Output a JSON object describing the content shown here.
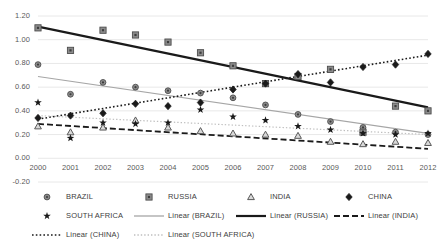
{
  "chart_data": {
    "type": "scatter",
    "title": "",
    "xlabel": "",
    "ylabel": "",
    "x": [
      2000,
      2001,
      2002,
      2003,
      2004,
      2005,
      2006,
      2007,
      2008,
      2009,
      2010,
      2011,
      2012
    ],
    "xlim": [
      1999.5,
      2012.5
    ],
    "ylim": [
      -0.2,
      1.2
    ],
    "yticks": [
      "-0.20",
      "0.00",
      "0.20",
      "0.40",
      "0.60",
      "0.80",
      "1.00",
      "1.20"
    ],
    "xticks": [
      "2000",
      "2001",
      "2002",
      "2003",
      "2004",
      "2005",
      "2006",
      "2007",
      "2008",
      "2009",
      "2010",
      "2011",
      "2012"
    ],
    "grid": "horizontal",
    "legend_position": "bottom",
    "series": [
      {
        "name": "BRAZIL",
        "marker": "circle",
        "color": "#808080",
        "values": [
          0.79,
          0.54,
          0.64,
          0.6,
          0.57,
          0.55,
          0.51,
          0.45,
          0.37,
          0.31,
          0.26,
          0.22,
          0.2
        ]
      },
      {
        "name": "RUSSIA",
        "marker": "square",
        "color": "#808080",
        "values": [
          1.1,
          0.91,
          1.08,
          1.04,
          0.98,
          0.89,
          0.78,
          0.63,
          0.69,
          0.75,
          0.22,
          0.44,
          0.4
        ]
      },
      {
        "name": "INDIA",
        "marker": "triangle",
        "color": "#808080",
        "values": [
          0.27,
          0.22,
          0.26,
          0.32,
          0.26,
          0.23,
          0.21,
          0.2,
          0.19,
          0.14,
          0.12,
          0.14,
          0.13
        ]
      },
      {
        "name": "CHINA",
        "marker": "diamond",
        "color": "#262626",
        "values": [
          0.34,
          0.36,
          0.38,
          0.46,
          0.44,
          0.47,
          0.58,
          0.63,
          0.71,
          0.64,
          0.77,
          0.79,
          0.88
        ]
      },
      {
        "name": "SOUTH AFRICA",
        "marker": "star",
        "color": "#262626",
        "values": [
          0.47,
          0.17,
          0.3,
          0.29,
          0.3,
          0.41,
          0.35,
          0.32,
          0.27,
          0.24,
          0.21,
          0.2,
          0.21
        ]
      }
    ],
    "trendlines": [
      {
        "name": "Linear (BRAZIL)",
        "style": "solid-light",
        "color": "#a6a6a6",
        "y_start": 0.69,
        "y_end": 0.21
      },
      {
        "name": "Linear (RUSSIA)",
        "style": "solid-bold",
        "color": "#1a1a1a",
        "y_start": 1.11,
        "y_end": 0.43
      },
      {
        "name": "Linear (INDIA)",
        "style": "dashed",
        "color": "#1a1a1a",
        "y_start": 0.29,
        "y_end": 0.08
      },
      {
        "name": "Linear (CHINA)",
        "style": "dotted",
        "color": "#1a1a1a",
        "y_start": 0.33,
        "y_end": 0.87
      },
      {
        "name": "Linear (SOUTH AFRICA)",
        "style": "dotted-light",
        "color": "#bfbfbf",
        "y_start": 0.36,
        "y_end": 0.2
      }
    ]
  },
  "legend": {
    "rows": [
      [
        {
          "label": "BRAZIL",
          "key": "marker-circle"
        },
        {
          "label": "RUSSIA",
          "key": "marker-square"
        },
        {
          "label": "INDIA",
          "key": "marker-triangle"
        },
        {
          "label": "CHINA",
          "key": "marker-diamond"
        }
      ],
      [
        {
          "label": "SOUTH AFRICA",
          "key": "marker-star"
        },
        {
          "label": "Linear (BRAZIL)",
          "key": "line-solid-light"
        },
        {
          "label": "Linear (RUSSIA)",
          "key": "line-solid-bold"
        },
        {
          "label": "Linear (INDIA)",
          "key": "line-dashed"
        }
      ],
      [
        {
          "label": "Linear (CHINA)",
          "key": "line-dotted"
        },
        {
          "label": "Linear (SOUTH AFRICA)",
          "key": "line-dotted-light"
        }
      ]
    ]
  },
  "colors": {
    "grid": "#e8e8e8",
    "text": "#595959",
    "dark": "#1a1a1a",
    "mid": "#808080",
    "light": "#bfbfbf"
  }
}
